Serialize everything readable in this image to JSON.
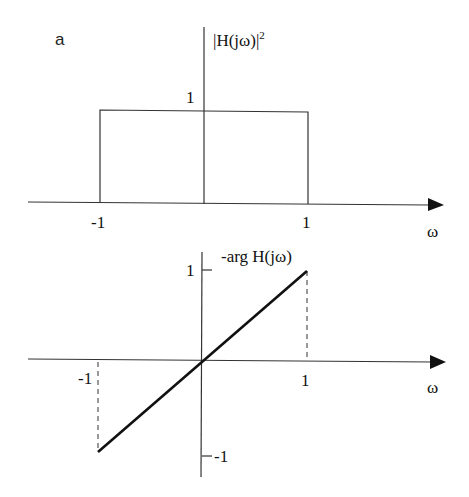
{
  "panel_label": "a",
  "top_plot": {
    "y_label": "|H(jω)|",
    "y_label_exp": "2",
    "level_label": "1",
    "x_ticks": [
      "-1",
      "1"
    ],
    "x_label": "ω"
  },
  "bottom_plot": {
    "y_label": "-arg H(jω)",
    "y_tick_top": "1",
    "y_tick_bottom": "-1",
    "x_ticks": [
      "-1",
      "1"
    ],
    "x_label": "ω"
  },
  "colors": {
    "axis": "#333333",
    "curve": "#111111",
    "background": "#ffffff"
  }
}
